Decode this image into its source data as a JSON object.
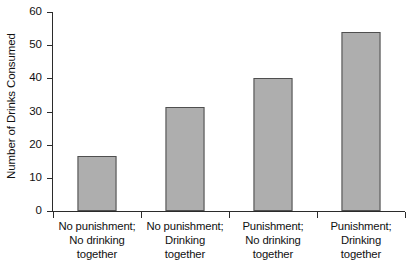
{
  "chart_data": {
    "type": "bar",
    "title": "",
    "xlabel": "",
    "ylabel": "Number of Drinks Consumed",
    "ylim": [
      0,
      60
    ],
    "yticks": [
      0,
      10,
      20,
      30,
      40,
      50,
      60
    ],
    "ytick_labels": [
      "0",
      "10",
      "20",
      "30",
      "40",
      "50",
      "60"
    ],
    "grid": false,
    "legend": false,
    "categories": [
      "No punishment; No drinking together",
      "No punishment; Drinking together",
      "Punishment; No drinking together",
      "Punishment; Drinking together"
    ],
    "category_lines": [
      [
        "No punishment;",
        "No drinking",
        "together"
      ],
      [
        "No punishment;",
        "Drinking",
        "together"
      ],
      [
        "Punishment;",
        "No drinking",
        "together"
      ],
      [
        "Punishment;",
        "Drinking",
        "together"
      ]
    ],
    "values": [
      16.5,
      31.5,
      40.2,
      54.0
    ],
    "series": [
      {
        "name": "Number of Drinks Consumed",
        "values": [
          16.5,
          31.5,
          40.2,
          54.0
        ]
      }
    ],
    "colors": {
      "bar_fill": "#aeaeae",
      "bar_stroke": "#4f4f4f",
      "axis": "#2b2b2b",
      "text": "#111111",
      "background": "#ffffff"
    }
  }
}
